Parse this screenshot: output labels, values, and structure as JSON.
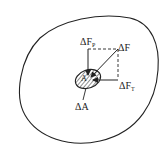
{
  "diagram": {
    "type": "stress-on-area-element",
    "labels": {
      "force_normal": {
        "base": "ΔF",
        "sub": "P"
      },
      "force_total": {
        "base": "ΔF",
        "sub": ""
      },
      "force_tangential": {
        "base": "ΔF",
        "sub": "T"
      },
      "area": "ΔA",
      "point": "A"
    },
    "colors": {
      "stroke": "#222222",
      "background": "#ffffff"
    }
  }
}
